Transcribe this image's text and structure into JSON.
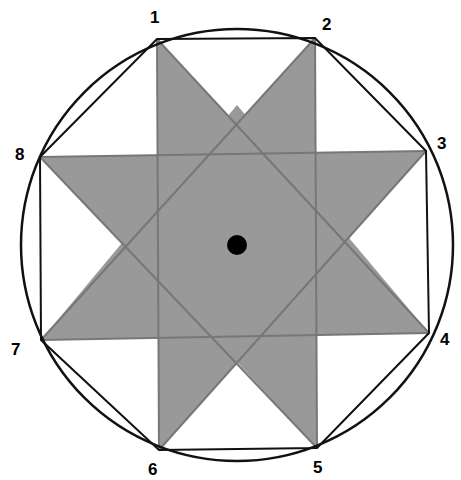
{
  "diagram": {
    "type": "octagram-in-circle",
    "colors": {
      "background": "#ffffff",
      "star_fill": "#999999",
      "inner_line": "#777777",
      "outer_line": "#111111",
      "center_dot": "#000000"
    },
    "circle": {
      "cx": 237,
      "cy": 245,
      "r": 216
    },
    "center_dot": {
      "cx": 237,
      "cy": 245,
      "r": 10
    },
    "points": [
      {
        "id": "1",
        "label": "1",
        "x": 157,
        "y": 39,
        "lx": 150,
        "ly": 23
      },
      {
        "id": "2",
        "label": "2",
        "x": 315,
        "y": 38,
        "lx": 322,
        "ly": 30
      },
      {
        "id": "3",
        "label": "3",
        "x": 426,
        "y": 151,
        "lx": 437,
        "ly": 149
      },
      {
        "id": "4",
        "label": "4",
        "x": 429,
        "y": 333,
        "lx": 440,
        "ly": 345
      },
      {
        "id": "5",
        "label": "5",
        "x": 317,
        "y": 448,
        "lx": 313,
        "ly": 473
      },
      {
        "id": "6",
        "label": "6",
        "x": 159,
        "y": 450,
        "lx": 148,
        "ly": 475
      },
      {
        "id": "7",
        "label": "7",
        "x": 41,
        "y": 340,
        "lx": 11,
        "ly": 355
      },
      {
        "id": "8",
        "label": "8",
        "x": 40,
        "y": 157,
        "lx": 15,
        "ly": 160
      }
    ],
    "triangles": [
      {
        "name": "triangle-1-6",
        "points": "157,39 159,450 345,243"
      },
      {
        "name": "triangle-2-5",
        "points": "315,38 317,448 128,245"
      },
      {
        "name": "triangle-8-3",
        "points": "40,157 426,151 237,363"
      },
      {
        "name": "triangle-7-4",
        "points": "41,340 429,333 237,105"
      }
    ],
    "inner_lines": [
      {
        "name": "line-1-6",
        "x1": 157,
        "y1": 39,
        "x2": 159,
        "y2": 450
      },
      {
        "name": "line-2-5",
        "x1": 315,
        "y1": 38,
        "x2": 317,
        "y2": 448
      },
      {
        "name": "line-8-3",
        "x1": 40,
        "y1": 157,
        "x2": 426,
        "y2": 151
      },
      {
        "name": "line-7-4",
        "x1": 41,
        "y1": 340,
        "x2": 429,
        "y2": 333
      },
      {
        "name": "line-1-4",
        "x1": 157,
        "y1": 39,
        "x2": 429,
        "y2": 333
      },
      {
        "name": "line-2-7",
        "x1": 315,
        "y1": 38,
        "x2": 41,
        "y2": 340
      },
      {
        "name": "line-3-6",
        "x1": 426,
        "y1": 151,
        "x2": 159,
        "y2": 450
      },
      {
        "name": "line-8-5",
        "x1": 40,
        "y1": 157,
        "x2": 317,
        "y2": 448
      }
    ],
    "octagon": "157,39 315,38 426,151 429,333 317,448 159,450 41,340 40,157"
  }
}
